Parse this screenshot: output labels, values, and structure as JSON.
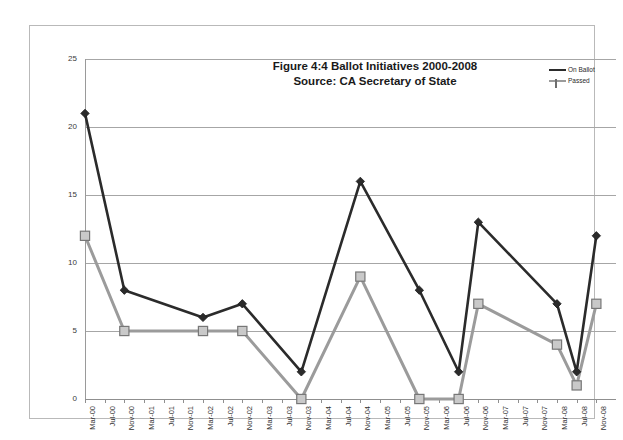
{
  "chart_data": {
    "type": "line",
    "title": "Figure 4:4 Ballot Initiatives 2000-2008",
    "subtitle": "Source: CA Secretary of State",
    "xlabel": "",
    "ylabel": "",
    "ylim": [
      0,
      25
    ],
    "yticks": [
      0,
      5,
      10,
      15,
      20,
      25
    ],
    "grid": true,
    "legend_position": "top-right",
    "categories": [
      "Mar-00",
      "Jul-00",
      "Nov-00",
      "Mar-01",
      "Jul-01",
      "Nov-01",
      "Mar-02",
      "Jul-02",
      "Nov-02",
      "Mar-03",
      "Jul-03",
      "Nov-03",
      "Mar-04",
      "Jul-04",
      "Nov-04",
      "Mar-05",
      "Jul-05",
      "Nov-05",
      "Mar-06",
      "Jul-06",
      "Nov-06",
      "Mar-07",
      "Jul-07",
      "Nov-07",
      "Mar-08",
      "Jul-08",
      "Nov-08"
    ],
    "series": [
      {
        "name": "On Ballot",
        "color": "#2b2b2b",
        "marker": "diamond",
        "points": [
          {
            "x": "Mar-00",
            "y": 21
          },
          {
            "x": "Nov-00",
            "y": 8
          },
          {
            "x": "Mar-02",
            "y": 6
          },
          {
            "x": "Nov-02",
            "y": 7
          },
          {
            "x": "Nov-03",
            "y": 2
          },
          {
            "x": "Nov-04",
            "y": 16
          },
          {
            "x": "Nov-05",
            "y": 8
          },
          {
            "x": "Jul-06",
            "y": 2
          },
          {
            "x": "Nov-06",
            "y": 13
          },
          {
            "x": "Mar-08",
            "y": 7
          },
          {
            "x": "Jul-08",
            "y": 2
          },
          {
            "x": "Nov-08",
            "y": 12
          }
        ]
      },
      {
        "name": "Passed",
        "color": "#9b9b9b",
        "marker": "square",
        "points": [
          {
            "x": "Mar-00",
            "y": 12
          },
          {
            "x": "Nov-00",
            "y": 5
          },
          {
            "x": "Mar-02",
            "y": 5
          },
          {
            "x": "Nov-02",
            "y": 5
          },
          {
            "x": "Nov-03",
            "y": 0
          },
          {
            "x": "Nov-04",
            "y": 9
          },
          {
            "x": "Nov-05",
            "y": 0
          },
          {
            "x": "Jul-06",
            "y": 0
          },
          {
            "x": "Nov-06",
            "y": 7
          },
          {
            "x": "Mar-08",
            "y": 4
          },
          {
            "x": "Jul-08",
            "y": 1
          },
          {
            "x": "Nov-08",
            "y": 7
          }
        ]
      }
    ]
  },
  "legend": {
    "items": [
      {
        "label": "On Ballot"
      },
      {
        "label": "Passed"
      }
    ]
  }
}
